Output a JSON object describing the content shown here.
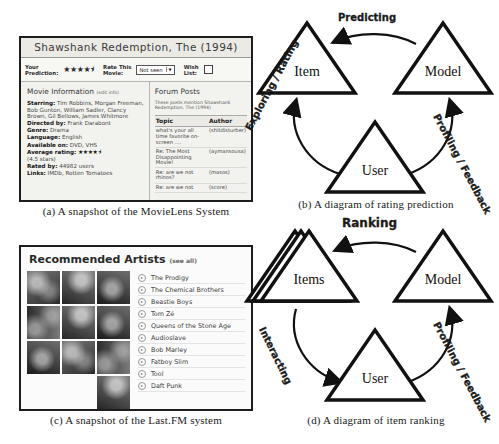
{
  "figure": {
    "captions": {
      "a": "(a) A snapshot of the MovieLens System",
      "b": "(b) A diagram of rating prediction",
      "c": "(c) A snapshot of the Last.FM system",
      "d": "(d) A diagram of item ranking"
    }
  },
  "movielens": {
    "title": "Shawshank Redemption, The (1994)",
    "ratebar": {
      "prediction_label_line1": "Your",
      "prediction_label_line2": "Prediction:",
      "prediction_stars": "★★★★⯨",
      "rate_label_line1": "Rate This",
      "rate_label_line2": "Movie:",
      "rate_select_value": "Not seen",
      "rate_select_arrow": "▼",
      "wish_label_line1": "Wish",
      "wish_label_line2": "List:"
    },
    "info": {
      "heading": "Movie Information",
      "heading_sub": "(edit info)",
      "starring_label": "Starring:",
      "starring_value": "Tim Robbins, Morgan Freeman, Bob Gunton, William Sadler, Clancy Brown, Gil Bellows, James Whitmore",
      "directed_label": "Directed by:",
      "directed_value": "Frank Darabont",
      "genre_label": "Genre:",
      "genre_value": "Drama",
      "language_label": "Language:",
      "language_value": "English",
      "available_label": "Available on:",
      "available_value": "DVD, VHS",
      "rating_label": "Average rating:",
      "rating_stars": "★★★★⯨",
      "rating_sub": "(4.5 stars)",
      "ratedby_label": "Rated by:",
      "ratedby_value": "44982 users",
      "links_label": "Links:",
      "links_value": "IMDb, Rotten Tomatoes"
    },
    "forum": {
      "heading": "Forum Posts",
      "note": "These posts mention Shawshank Redemption, The (1994)",
      "col_topic": "Topic",
      "col_author": "Author",
      "rows": [
        {
          "topic": "what's your all time favorite on-screen ....",
          "author": "(shitdisturber)"
        },
        {
          "topic": "Re: The Most Disappointing Movie!",
          "author": "(aymansousa)"
        },
        {
          "topic": "Re: are we not rhinos?",
          "author": "(masos)"
        },
        {
          "topic": "Re: are we not",
          "author": "(score)"
        }
      ]
    }
  },
  "lastfm": {
    "title": "Recommended Artists",
    "see_all": "(see all)",
    "artists": [
      "The Prodigy",
      "The Chemical Brothers",
      "Beastie Boys",
      "Tom Zé",
      "Queens of the Stone Age",
      "Audioslave",
      "Bob Marley",
      "Fatboy Slim",
      "Tool",
      "Daft Punk"
    ],
    "play_icon": "▸"
  },
  "diagram_b": {
    "nodes": {
      "item": "Item",
      "model": "Model",
      "user": "User"
    },
    "edges": {
      "top": "Predicting",
      "left": "Exploring / Rating",
      "right": "Profiling / Feedback"
    }
  },
  "diagram_d": {
    "nodes": {
      "items": "Items",
      "model": "Model",
      "user": "User"
    },
    "edges": {
      "top": "Ranking",
      "left": "Interacting",
      "right": "Profiling / Feedback"
    }
  }
}
